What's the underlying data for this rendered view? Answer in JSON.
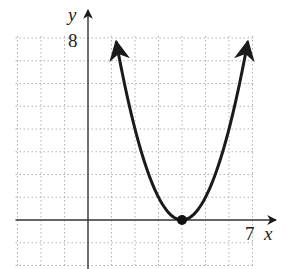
{
  "chart_data": {
    "type": "line",
    "title": "",
    "xlabel": "x",
    "ylabel": "y",
    "xlim": [
      -3,
      7
    ],
    "ylim": [
      -2,
      8
    ],
    "grid": true,
    "grid_style": "dotted",
    "tick_labels": {
      "x_max": "7",
      "y_max": "8"
    },
    "series": [
      {
        "name": "parabola",
        "function": "y = (x - 4)^2",
        "x": [
          1.2,
          2,
          3,
          4,
          5,
          6,
          6.8
        ],
        "y": [
          7.84,
          4,
          1,
          0,
          1,
          4,
          7.84
        ],
        "arrows_both_ends": true
      }
    ],
    "points": [
      {
        "label": "vertex",
        "x": 4,
        "y": 0,
        "filled": true
      }
    ]
  },
  "labels": {
    "x_axis": "x",
    "y_axis": "y",
    "x_tick": "7",
    "y_tick": "8"
  },
  "colors": {
    "curve": "#1a1a1a",
    "axis": "#333333",
    "grid": "#b0b0b0"
  }
}
